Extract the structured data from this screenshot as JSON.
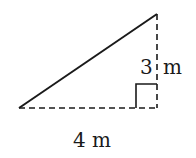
{
  "diagram": {
    "type": "right-triangle",
    "labels": {
      "base": "4 m",
      "height_num": "3",
      "height_unit": "m"
    },
    "colors": {
      "stroke": "#1a1a1a",
      "background": "#ffffff"
    }
  }
}
